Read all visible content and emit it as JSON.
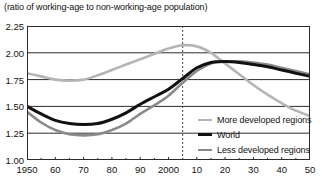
{
  "chart_data": {
    "type": "line",
    "title": "(ratio of working-age to non-working-age population)",
    "xlabel": "",
    "ylabel": "",
    "xlim": [
      1950,
      2050
    ],
    "ylim": [
      1.0,
      2.25
    ],
    "grid": true,
    "grid_axis": "y",
    "legend_position": "inside-bottom-right",
    "x_ticks": [
      1950,
      1960,
      1970,
      1980,
      1990,
      2000,
      2010,
      2020,
      2030,
      2040,
      2050
    ],
    "x_tick_labels": [
      "1950",
      "60",
      "70",
      "80",
      "90",
      "2000",
      "10",
      "20",
      "30",
      "40",
      "50"
    ],
    "y_ticks": [
      1.0,
      1.25,
      1.5,
      1.75,
      2.0,
      2.25
    ],
    "y_tick_labels": [
      "1.00",
      "1.25",
      "1.50",
      "1.75",
      "2.00",
      "2.25"
    ],
    "annotations": [
      {
        "name": "projection-divider",
        "type": "vline",
        "x": 2005,
        "style": "dashed"
      }
    ],
    "x": [
      1950,
      1955,
      1960,
      1965,
      1970,
      1975,
      1980,
      1985,
      1990,
      1995,
      2000,
      2005,
      2010,
      2015,
      2020,
      2025,
      2030,
      2035,
      2040,
      2045,
      2050
    ],
    "series": [
      {
        "name": "More developed regions",
        "color": "#b5b5b5",
        "width": 2.6,
        "values": [
          1.81,
          1.78,
          1.75,
          1.74,
          1.75,
          1.79,
          1.84,
          1.89,
          1.94,
          1.99,
          2.04,
          2.07,
          2.06,
          2.0,
          1.9,
          1.8,
          1.7,
          1.61,
          1.53,
          1.46,
          1.41
        ]
      },
      {
        "name": "World",
        "color": "#111111",
        "width": 3.0,
        "values": [
          1.5,
          1.43,
          1.37,
          1.34,
          1.33,
          1.34,
          1.38,
          1.44,
          1.52,
          1.59,
          1.66,
          1.76,
          1.86,
          1.91,
          1.92,
          1.91,
          1.89,
          1.87,
          1.84,
          1.81,
          1.78
        ]
      },
      {
        "name": "Less developed regions",
        "color": "#8a8a8a",
        "width": 2.6,
        "values": [
          1.45,
          1.35,
          1.28,
          1.24,
          1.23,
          1.24,
          1.28,
          1.34,
          1.43,
          1.51,
          1.6,
          1.72,
          1.83,
          1.9,
          1.92,
          1.92,
          1.91,
          1.89,
          1.86,
          1.83,
          1.8
        ]
      }
    ]
  },
  "legend": {
    "entries": [
      {
        "label": "More developed regions",
        "color": "#b5b5b5"
      },
      {
        "label": "World",
        "color": "#111111"
      },
      {
        "label": "Less developed regions",
        "color": "#8a8a8a"
      }
    ]
  }
}
